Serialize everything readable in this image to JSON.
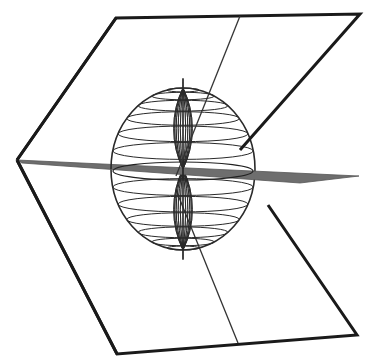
{
  "figure": {
    "colors": {
      "background": "#ffffff",
      "outline": "#1a1a1a",
      "horizontal_plane": "#6e6e6e",
      "wireframe": "#2a2a2a"
    },
    "upper_plane": [
      [
        17,
        160
      ],
      [
        116,
        18
      ],
      [
        360,
        14
      ],
      [
        240,
        150
      ]
    ],
    "lower_plane": [
      [
        17,
        160
      ],
      [
        117,
        354
      ],
      [
        357,
        335
      ],
      [
        258,
        200
      ]
    ],
    "center_line": [
      [
        240,
        16
      ],
      [
        176,
        176
      ],
      [
        238,
        343
      ]
    ],
    "horizontal_plane": [
      [
        17,
        160
      ],
      [
        359,
        176
      ],
      [
        300,
        182
      ],
      [
        30,
        163
      ]
    ],
    "sphere": {
      "cx": 183,
      "cy": 169,
      "rx": 72,
      "ry": 81,
      "meridians": 12,
      "parallels": 14
    }
  }
}
